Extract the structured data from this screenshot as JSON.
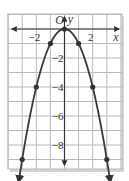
{
  "chart_data": {
    "type": "line",
    "title": "",
    "function": "y = -x^2",
    "xlabel": "x",
    "ylabel": "y",
    "origin_label": "O",
    "xlim": [
      -4,
      4
    ],
    "ylim": [
      -10,
      1
    ],
    "grid": true,
    "grid_step": 1,
    "x_tick_labels": [
      {
        "value": -2,
        "label": "−2"
      },
      {
        "value": 2,
        "label": "2"
      }
    ],
    "y_tick_labels": [
      {
        "value": -2,
        "label": "−2"
      },
      {
        "value": -4,
        "label": "−4"
      },
      {
        "value": -6,
        "label": "−6"
      },
      {
        "value": -8,
        "label": "−8"
      }
    ],
    "points": [
      {
        "x": -3,
        "y": -9
      },
      {
        "x": -2,
        "y": -4
      },
      {
        "x": -1,
        "y": -1
      },
      {
        "x": 0,
        "y": 0
      },
      {
        "x": 1,
        "y": -1
      },
      {
        "x": 2,
        "y": -4
      },
      {
        "x": 3,
        "y": -9
      }
    ],
    "curve_ends_with_arrows": true,
    "colors": {
      "grid": "#b9b9b9",
      "axis": "#333333",
      "curve": "#3a3a3a",
      "point": "#333333",
      "shadow": "#cfcfcf"
    }
  }
}
